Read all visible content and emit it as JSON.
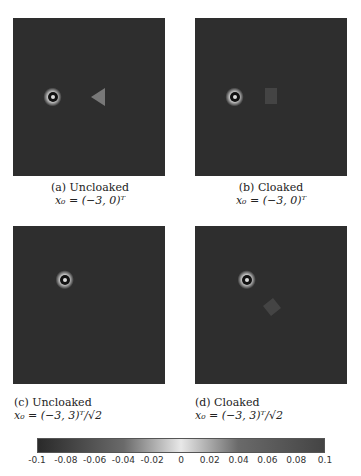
{
  "chart_data": [
    {
      "type": "heatmap",
      "panel": "a",
      "title": "(a) Uncloaked",
      "subtitle": "x0 = (-3,0)^T",
      "source": [
        -3,
        0
      ],
      "cloaked": false
    },
    {
      "type": "heatmap",
      "panel": "b",
      "title": "(b) Cloaked",
      "subtitle": "x0 = (-3,0)^T",
      "source": [
        -3,
        0
      ],
      "cloaked": true
    },
    {
      "type": "heatmap",
      "panel": "c",
      "title": "(c) Uncloaked",
      "subtitle": "x0 = (-3,3)^T/√2",
      "source": [
        -2.12,
        2.12
      ],
      "cloaked": false
    },
    {
      "type": "heatmap",
      "panel": "d",
      "title": "(d) Cloaked",
      "subtitle": "x0 = (-3,3)^T/√2",
      "source": [
        -2.12,
        2.12
      ],
      "cloaked": true
    }
  ],
  "colorbar": {
    "range": [
      -0.1,
      0.1
    ],
    "ticks": [
      "-0.1",
      "-0.08",
      "-0.06",
      "-0.04",
      "-0.02",
      "0",
      "0.02",
      "0.04",
      "0.06",
      "0.08",
      "0.1"
    ]
  },
  "captions": {
    "a": {
      "l1": "(a)  Uncloaked",
      "l2": "x₀ = (−3, 0)ᵀ"
    },
    "b": {
      "l1": "(b)  Cloaked",
      "l2": "x₀ = (−3, 0)ᵀ"
    },
    "c": {
      "l1": "(c)  Uncloaked",
      "l2": "x₀ = (−3, 3)ᵀ/√2"
    },
    "d": {
      "l1": "(d)  Cloaked",
      "l2": "x₀ = (−3, 3)ᵀ/√2"
    }
  }
}
